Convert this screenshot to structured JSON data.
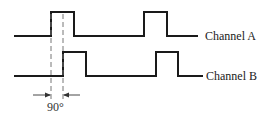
{
  "diagram": {
    "type": "quadrature-encoder-timing",
    "channels": [
      {
        "name": "Channel A",
        "label": "Channel A",
        "pulses": [
          [
            51,
            74
          ],
          [
            144,
            167
          ]
        ]
      },
      {
        "name": "Channel B",
        "label": "Channel B",
        "pulses": [
          [
            63,
            86
          ],
          [
            156,
            178
          ]
        ]
      }
    ],
    "phase_shift_label": "90°",
    "colors": {
      "line": "#1a1a1a",
      "dashed": "#777777",
      "text": "#222222"
    }
  }
}
